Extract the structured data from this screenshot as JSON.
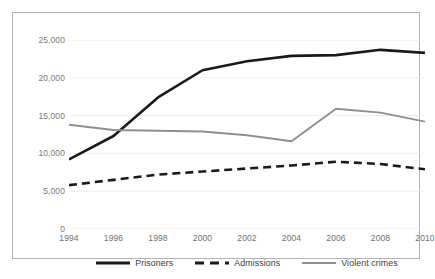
{
  "chart_data": {
    "type": "line",
    "title": "",
    "subtitle": "",
    "xlabel": "",
    "ylabel": "",
    "categories": [
      "1994",
      "1996",
      "1998",
      "2000",
      "2002",
      "2004",
      "2006",
      "2008",
      "2010"
    ],
    "x": [
      1994,
      1996,
      1998,
      2000,
      2002,
      2004,
      2006,
      2008,
      2010
    ],
    "xlim": [
      1994,
      2010
    ],
    "ylim": [
      0,
      25000
    ],
    "y_ticks": [
      25000,
      20000,
      15000,
      10000,
      5000,
      0
    ],
    "y_tick_labels": [
      "25,000",
      "20,000",
      "15,000",
      "10,000",
      "5,000",
      "0"
    ],
    "x_tick_labels": [
      "1994",
      "1996",
      "1998",
      "2000",
      "2002",
      "2004",
      "2006",
      "2008",
      "2010"
    ],
    "grid": true,
    "grid_axis": "y",
    "legend_position": "bottom",
    "series": [
      {
        "name": "Prisoners",
        "values": [
          9200,
          12300,
          17400,
          21000,
          22200,
          22900,
          23000,
          23700,
          23300
        ],
        "color": "#1a1a1a",
        "style": "solid",
        "width": 2.6
      },
      {
        "name": "Admissions",
        "values": [
          5800,
          6500,
          7200,
          7600,
          8000,
          8400,
          8900,
          8600,
          7900
        ],
        "color": "#1a1a1a",
        "style": "dashed",
        "width": 2.6
      },
      {
        "name": "Violent crimes",
        "values": [
          13800,
          13100,
          13000,
          12900,
          12400,
          11600,
          15900,
          15400,
          14200
        ],
        "color": "#8f8f8f",
        "style": "solid",
        "width": 1.9
      }
    ]
  },
  "legend": {
    "items": [
      {
        "label": "Prisoners"
      },
      {
        "label": "Admissions"
      },
      {
        "label": "Violent crimes"
      }
    ]
  },
  "colors": {
    "frame_border": "#b4b4b4",
    "gridline": "#ededed",
    "tick_text": "#7a7a7a",
    "legend_text": "#3a3a3a",
    "background": "#ffffff"
  }
}
